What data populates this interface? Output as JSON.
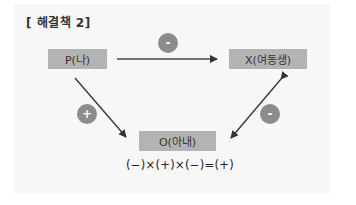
{
  "title": "[ 해결책 2]",
  "nodes": {
    "p": "P(나)",
    "x": "X(여동생)",
    "o": "O(아내)"
  },
  "edges": [
    {
      "from": "P(나)",
      "to": "X(여동생)",
      "sign": "-"
    },
    {
      "from": "P(나)",
      "to": "O(아내)",
      "sign": "+"
    },
    {
      "from": "X(여동생)",
      "to": "O(아내)",
      "sign": "-",
      "bidirectional": true
    }
  ],
  "signs": {
    "px": "-",
    "po": "+",
    "xo": "-"
  },
  "formula": "(−)×(+)×(−)=(+)",
  "colors": {
    "node_bg": "#b3b3b3",
    "sign_bg": "#8c8c8c",
    "arrow": "#333333"
  }
}
